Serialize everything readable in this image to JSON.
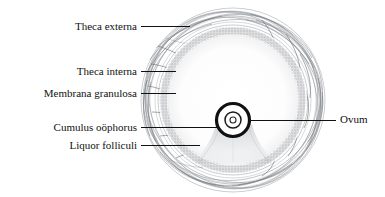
{
  "figure": {
    "type": "histology-diagram",
    "background_color": "#ffffff",
    "ink_color": "#111111",
    "fiber_color": "#8b8f96",
    "stipple_color": "#6f7378",
    "follicle": {
      "center_x": 233,
      "center_y": 100,
      "outer_radius": 92,
      "theca_externa_inner_radius": 80,
      "theca_interna_inner_radius": 72,
      "granulosa_inner_radius": 66,
      "antrum_radius": 66
    },
    "ovum": {
      "center_x": 233,
      "center_y": 120,
      "outer_ring_radius": 17,
      "zona_gap_radius": 12,
      "inner_ring_radius": 8,
      "nucleus_radius": 3
    }
  },
  "labels": {
    "theca_externa": "Theca externa",
    "theca_interna": "Theca interna",
    "membrana_granulosa": "Membrana granulosa",
    "cumulus_oophorus": "Cumulus oöphorus",
    "liquor_folliculi": "Liquor folliculi",
    "ovum": "Ovum"
  },
  "leaders": [
    {
      "name": "theca-externa",
      "x1": 141,
      "y1": 26,
      "x2": 190,
      "y2": 26
    },
    {
      "name": "theca-interna",
      "x1": 141,
      "y1": 71,
      "x2": 176,
      "y2": 71
    },
    {
      "name": "membrana-granulosa",
      "x1": 141,
      "y1": 93,
      "x2": 176,
      "y2": 93
    },
    {
      "name": "cumulus-oophorus",
      "x1": 141,
      "y1": 127,
      "x2": 217,
      "y2": 127
    },
    {
      "name": "liquor-folliculi",
      "x1": 141,
      "y1": 145,
      "x2": 200,
      "y2": 145
    },
    {
      "name": "ovum",
      "x1": 248,
      "y1": 120,
      "x2": 336,
      "y2": 120
    }
  ]
}
